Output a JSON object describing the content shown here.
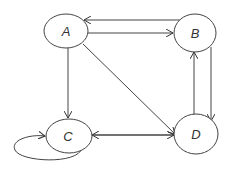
{
  "diagram": {
    "type": "directed-graph",
    "nodes": [
      {
        "id": "A",
        "label": "A",
        "cx": 66,
        "cy": 31,
        "rx": 22,
        "ry": 17
      },
      {
        "id": "B",
        "label": "B",
        "cx": 195,
        "cy": 33,
        "rx": 21,
        "ry": 19
      },
      {
        "id": "C",
        "label": "C",
        "cx": 68,
        "cy": 136,
        "rx": 23,
        "ry": 17
      },
      {
        "id": "D",
        "label": "D",
        "cx": 196,
        "cy": 134,
        "rx": 22,
        "ry": 20
      }
    ],
    "edges": [
      {
        "from": "B",
        "to": "A"
      },
      {
        "from": "A",
        "to": "B"
      },
      {
        "from": "A",
        "to": "C"
      },
      {
        "from": "A",
        "to": "D"
      },
      {
        "from": "C",
        "to": "D"
      },
      {
        "from": "D",
        "to": "C"
      },
      {
        "from": "B",
        "to": "D"
      },
      {
        "from": "D",
        "to": "B"
      },
      {
        "from": "C",
        "to": "C"
      }
    ],
    "colors": {
      "stroke": "#333333",
      "background": "#ffffff"
    }
  }
}
